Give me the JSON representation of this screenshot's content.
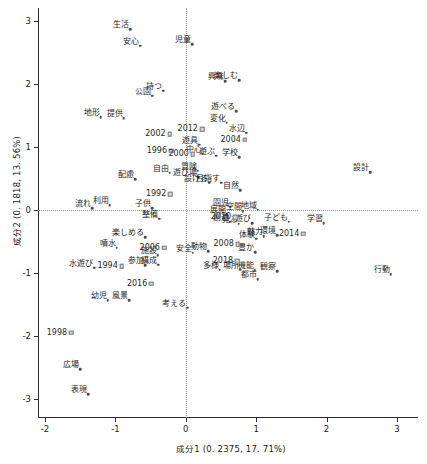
{
  "chart_data": {
    "type": "scatter",
    "title": "",
    "xlabel": "成分1  (0. 2375,  17. 71%)",
    "ylabel": "成分2  (0. 1818,  13. 56%)",
    "xlim": [
      -2.1,
      3.3
    ],
    "ylim": [
      -3.3,
      3.2
    ],
    "xticks": [
      -2,
      -1,
      0,
      1,
      2,
      3
    ],
    "xticklabels": [
      "-2",
      "-1",
      "0",
      "1",
      "2",
      "3"
    ],
    "yticks": [
      -3,
      -2,
      -1,
      0,
      1,
      2,
      3
    ],
    "yticklabels": [
      "-3",
      "-2",
      "-1",
      "0",
      "1",
      "2",
      "3"
    ],
    "grid": false,
    "legend": "none",
    "zero_lines": true,
    "series": [
      {
        "name": "words",
        "marker": "dot",
        "points": [
          {
            "label": "生活",
            "x": -0.79,
            "y": 2.86
          },
          {
            "label": "安心",
            "x": -0.65,
            "y": 2.6
          },
          {
            "label": "児童",
            "x": 0.09,
            "y": 2.63
          },
          {
            "label": "興味",
            "x": 0.56,
            "y": 2.04
          },
          {
            "label": "楽しむ",
            "x": 0.76,
            "y": 2.06
          },
          {
            "label": "公園",
            "x": -0.48,
            "y": 1.81
          },
          {
            "label": "持つ",
            "x": -0.32,
            "y": 1.89
          },
          {
            "label": "遊べる",
            "x": 0.72,
            "y": 1.56
          },
          {
            "label": "地形",
            "x": -1.21,
            "y": 1.47
          },
          {
            "label": "提供",
            "x": -0.88,
            "y": 1.45
          },
          {
            "label": "変化",
            "x": 0.58,
            "y": 1.38
          },
          {
            "label": "水辺",
            "x": 0.86,
            "y": 1.22
          },
          {
            "label": "遊具",
            "x": 0.19,
            "y": 1.03
          },
          {
            "label": "中心",
            "x": 0.24,
            "y": 0.89
          },
          {
            "label": "遊ぶ",
            "x": 0.43,
            "y": 0.86
          },
          {
            "label": "学校",
            "x": 0.76,
            "y": 0.83
          },
          {
            "label": "設計",
            "x": 2.62,
            "y": 0.6
          },
          {
            "label": "自由",
            "x": -0.23,
            "y": 0.59
          },
          {
            "label": "冒険",
            "x": 0.17,
            "y": 0.62
          },
          {
            "label": "遊び場",
            "x": 0.18,
            "y": 0.52
          },
          {
            "label": "設ける",
            "x": 0.33,
            "y": 0.43
          },
          {
            "label": "目指す",
            "x": 0.5,
            "y": 0.43
          },
          {
            "label": "配慮",
            "x": -0.72,
            "y": 0.49
          },
          {
            "label": "自然",
            "x": 0.77,
            "y": 0.31
          },
          {
            "label": "流れ",
            "x": -1.33,
            "y": 0.03
          },
          {
            "label": "利用",
            "x": -1.08,
            "y": 0.07
          },
          {
            "label": "子供",
            "x": -0.48,
            "y": 0.03
          },
          {
            "label": "園児",
            "x": 0.63,
            "y": 0.05
          },
          {
            "label": "空間",
            "x": 0.81,
            "y": -0.02
          },
          {
            "label": "地域",
            "x": 1.02,
            "y": 0.0
          },
          {
            "label": "展開",
            "x": 0.58,
            "y": -0.07
          },
          {
            "label": "整備",
            "x": -0.38,
            "y": -0.14
          },
          {
            "label": "創造",
            "x": 0.63,
            "y": -0.19
          },
          {
            "label": "見る",
            "x": 0.75,
            "y": -0.22
          },
          {
            "label": "遊び",
            "x": 0.94,
            "y": -0.21
          },
          {
            "label": "子ども",
            "x": 1.46,
            "y": -0.19
          },
          {
            "label": "学習",
            "x": 1.96,
            "y": -0.21
          },
          {
            "label": "楽しめる",
            "x": -0.58,
            "y": -0.43
          },
          {
            "label": "体験",
            "x": 1.0,
            "y": -0.46
          },
          {
            "label": "魅力",
            "x": 1.11,
            "y": -0.42
          },
          {
            "label": "環境",
            "x": 1.3,
            "y": -0.4
          },
          {
            "label": "噴水",
            "x": -0.98,
            "y": -0.6
          },
          {
            "label": "施設",
            "x": -0.4,
            "y": -0.72
          },
          {
            "label": "安全",
            "x": 0.1,
            "y": -0.68
          },
          {
            "label": "動物",
            "x": 0.32,
            "y": -0.66
          },
          {
            "label": "豊か",
            "x": 0.99,
            "y": -0.67
          },
          {
            "label": "水遊び",
            "x": -1.3,
            "y": -0.92
          },
          {
            "label": "参加",
            "x": -0.58,
            "y": -0.88
          },
          {
            "label": "構成",
            "x": -0.39,
            "y": -0.87
          },
          {
            "label": "多様",
            "x": 0.48,
            "y": -0.95
          },
          {
            "label": "場所",
            "x": 0.77,
            "y": -0.95
          },
          {
            "label": "機能",
            "x": 0.98,
            "y": -0.96
          },
          {
            "label": "観察",
            "x": 1.3,
            "y": -0.97
          },
          {
            "label": "都市",
            "x": 1.02,
            "y": -1.1
          },
          {
            "label": "行動",
            "x": 2.91,
            "y": -1.02
          },
          {
            "label": "幼児",
            "x": -1.11,
            "y": -1.43
          },
          {
            "label": "風景",
            "x": -0.8,
            "y": -1.43
          },
          {
            "label": "考える",
            "x": 0.02,
            "y": -1.55
          },
          {
            "label": "広場",
            "x": -1.5,
            "y": -2.53
          },
          {
            "label": "表現",
            "x": -1.39,
            "y": -2.92
          }
        ]
      },
      {
        "name": "years",
        "marker": "square",
        "points": [
          {
            "label": "2012",
            "x": 0.23,
            "y": 1.28
          },
          {
            "label": "2002",
            "x": -0.23,
            "y": 1.2
          },
          {
            "label": "1996",
            "x": -0.21,
            "y": 0.94
          },
          {
            "label": "2000",
            "x": 0.1,
            "y": 0.88
          },
          {
            "label": "2004",
            "x": 0.84,
            "y": 1.11
          },
          {
            "label": "1992",
            "x": -0.22,
            "y": 0.25
          },
          {
            "label": "2010",
            "x": 0.7,
            "y": -0.12
          },
          {
            "label": "2014",
            "x": 1.67,
            "y": -0.38
          },
          {
            "label": "2008",
            "x": 0.74,
            "y": -0.54
          },
          {
            "label": "2006",
            "x": -0.31,
            "y": -0.6
          },
          {
            "label": "2018",
            "x": 0.73,
            "y": -0.81
          },
          {
            "label": "1994",
            "x": -0.91,
            "y": -0.89
          },
          {
            "label": "2016",
            "x": -0.49,
            "y": -1.17
          },
          {
            "label": "1998",
            "x": -1.63,
            "y": -1.95
          }
        ]
      }
    ]
  }
}
